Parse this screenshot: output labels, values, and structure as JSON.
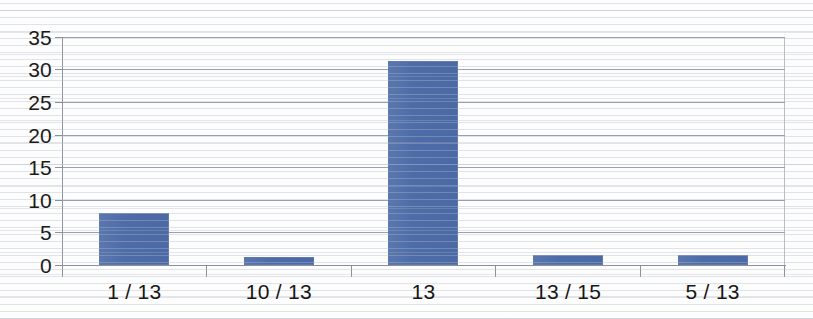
{
  "chart_data": {
    "type": "bar",
    "title": "",
    "subtitle": "",
    "xlabel": "",
    "ylabel": "",
    "categories": [
      "1 / 13",
      "10 / 13",
      "13",
      "13 / 15",
      "5 / 13"
    ],
    "values": [
      8,
      1.3,
      31.3,
      1.5,
      1.5
    ],
    "series": [
      {
        "name": "",
        "values": [
          8,
          1.3,
          31.3,
          1.5,
          1.5
        ]
      }
    ],
    "ylim": [
      0,
      35
    ],
    "ytick_labels": [
      "0",
      "5",
      "10",
      "15",
      "20",
      "25",
      "30",
      "35"
    ],
    "ytick_values": [
      0,
      5,
      10,
      15,
      20,
      25,
      30,
      35
    ],
    "grid": true,
    "grid_axis": "y",
    "legend": false,
    "legend_position": "none",
    "bar_color": "#4e6da8",
    "bar_border_color": "#5e79b0",
    "axis_color": "#8a8f99",
    "gridline_color": "#9aa0ac",
    "background_color": "#fdfdfd",
    "annotations": []
  }
}
